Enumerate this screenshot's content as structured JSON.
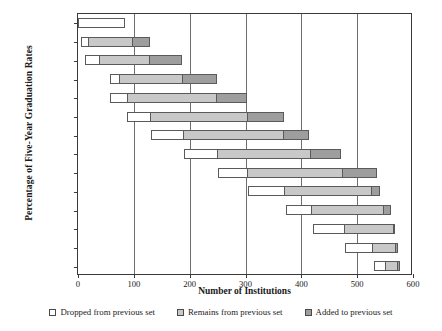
{
  "chart_data": {
    "type": "bar",
    "subtype": "horizontal-stacked-floating",
    "title": "",
    "xlabel": "Number of Institutions",
    "ylabel": "Percentage of Five-Year Graduation Rates",
    "xlim": [
      0,
      600
    ],
    "xticks": [
      0,
      100,
      200,
      300,
      400,
      500,
      600
    ],
    "grid": "vertical",
    "legend_position": "bottom",
    "categories": [
      "75-100",
      "70-95",
      "65-90",
      "60-85",
      "55-80",
      "50-75",
      "45-70",
      "40-65",
      "35-60",
      "30-55",
      "25-50",
      "20-45",
      "15-40",
      "10-35"
    ],
    "legend": [
      "Dropped from previous set",
      "Remains from previous set",
      "Added to previous set"
    ],
    "series": [
      {
        "name": "Dropped from previous set",
        "values": [
          85,
          15,
          27,
          18,
          32,
          42,
          60,
          60,
          55,
          65,
          48,
          58,
          50,
          22
        ]
      },
      {
        "name": "Remains from previous set",
        "values": [
          0,
          80,
          90,
          115,
          160,
          177,
          180,
          170,
          172,
          158,
          130,
          89,
          44,
          23
        ]
      },
      {
        "name": "Added to previous set",
        "values": [
          0,
          33,
          60,
          63,
          57,
          65,
          48,
          55,
          63,
          17,
          15,
          5,
          5,
          5
        ]
      }
    ],
    "bar_starts": [
      0,
      5,
      13,
      57,
      58,
      88,
      130,
      190,
      250,
      305,
      372,
      420,
      478,
      530
    ],
    "bar_ends": [
      85,
      133,
      190,
      253,
      307,
      372,
      418,
      475,
      540,
      545,
      565,
      572,
      577,
      580
    ],
    "colors": {
      "dropped": "#ffffff",
      "remains": "#c8c8c8",
      "added": "#9e9e9e",
      "axis": "#3a3a3a",
      "grid": "#6e6e6e"
    }
  }
}
